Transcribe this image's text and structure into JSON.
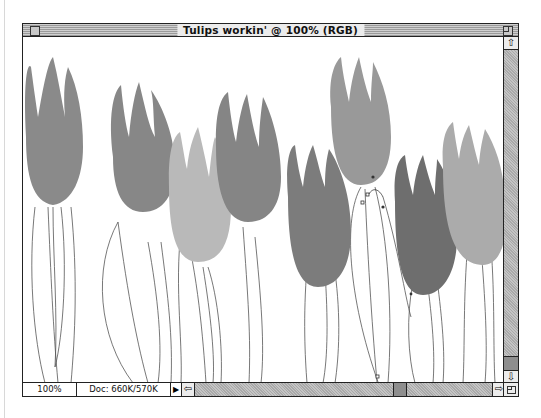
{
  "window": {
    "title": "Tulips workin' @ 100% (RGB)",
    "document_name": "Tulips workin'",
    "zoom_in_title": "100%",
    "color_mode": "RGB"
  },
  "statusbar": {
    "zoom_level": "100%",
    "doc_size": "Doc: 660K/570K",
    "popup_arrow": "▶"
  },
  "scrollbars": {
    "up_arrow": "⇧",
    "down_arrow": "⇩",
    "left_arrow": "⇦",
    "right_arrow": "⇨"
  },
  "icons": {
    "close_box": "close-box-icon",
    "zoom_box": "zoom-box-icon",
    "grow_box": "resize-grip-icon"
  },
  "canvas": {
    "subject": "tulips illustration with path outlines",
    "colors": {
      "dark_tulip": "#7e7e7e",
      "mid_tulip": "#8f8f8f",
      "light_tulip": "#b8b8b8",
      "lighter_tulip": "#a4a4a4",
      "stem_outline": "#555555"
    }
  }
}
